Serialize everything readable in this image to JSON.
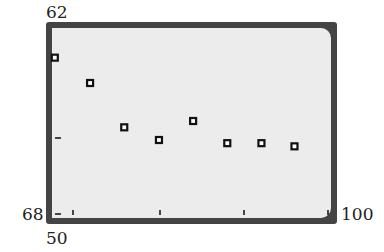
{
  "chart_data": {
    "type": "scatter",
    "title": "",
    "xlabel": "",
    "ylabel": "",
    "xlim": [
      50,
      100
    ],
    "ylim": [
      68,
      62
    ],
    "axis_labels": {
      "y_top": "62",
      "y_bottom": "68",
      "x_left": "50",
      "x_right": "100"
    },
    "grid": false,
    "x": [
      50.5,
      56.8,
      62.9,
      69.1,
      75.2,
      81.3,
      87.4,
      93.3
    ],
    "y": [
      63.0,
      63.8,
      65.2,
      65.6,
      65.0,
      65.7,
      65.7,
      65.8
    ],
    "marker": "square",
    "colors": {
      "frame": "#444444",
      "screen": "#ececec",
      "marker": "#111111"
    }
  }
}
